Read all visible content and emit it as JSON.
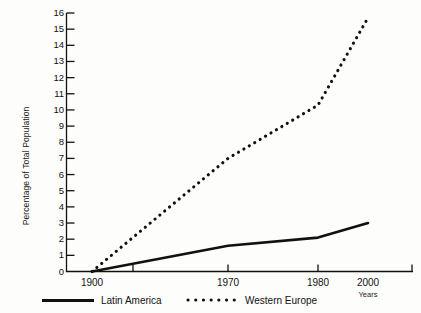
{
  "chart_data": {
    "type": "line",
    "title": "",
    "subtitle": "",
    "xlabel": "Years",
    "ylabel": "Percentage of Total Population",
    "x": [
      1900,
      1970,
      1980,
      2000
    ],
    "xticklabels": [
      "1900",
      "1970",
      "1980",
      "2000"
    ],
    "xlim": [
      1900,
      2000
    ],
    "ylim": [
      0,
      16
    ],
    "yticks": [
      0,
      1,
      2,
      3,
      4,
      5,
      6,
      7,
      8,
      9,
      10,
      11,
      12,
      13,
      14,
      15,
      16
    ],
    "yticklabels": [
      "0",
      "1",
      "2",
      "3",
      "4",
      "5",
      "6",
      "7",
      "8",
      "9",
      "10",
      "11",
      "12",
      "13",
      "14",
      "15",
      "16"
    ],
    "grid": false,
    "legend_position": "bottom",
    "series": [
      {
        "name": "Latin America",
        "style": "solid",
        "color": "#111111",
        "values": [
          0,
          1.6,
          2.1,
          3.0
        ]
      },
      {
        "name": "Western Europe",
        "style": "dotted",
        "color": "#111111",
        "values": [
          0,
          7.0,
          10.3,
          15.7
        ]
      }
    ]
  },
  "axes": {
    "y_title": "Percentage of Total Population",
    "x_title": "Years"
  },
  "legend": {
    "items": [
      {
        "label": "Latin America",
        "style": "solid"
      },
      {
        "label": "Western Europe",
        "style": "dotted"
      }
    ]
  }
}
